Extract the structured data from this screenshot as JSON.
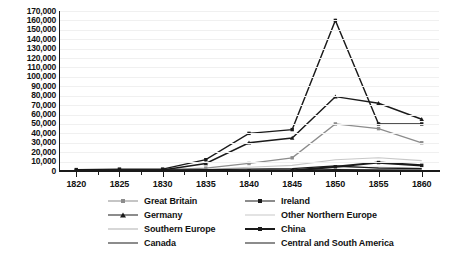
{
  "chart_data": {
    "type": "line",
    "title": "",
    "xlabel": "",
    "ylabel": "",
    "x": [
      1820,
      1825,
      1830,
      1835,
      1840,
      1845,
      1850,
      1855,
      1860
    ],
    "xlim": [
      1818,
      1862
    ],
    "ylim": [
      0,
      170000
    ],
    "ytick_labels": [
      "170,000",
      "160,000",
      "150,000",
      "140,000",
      "130,000",
      "120,000",
      "110,000",
      "100,000",
      "90,000",
      "80,000",
      "70,000",
      "60,000",
      "50,000",
      "40,000",
      "30,000",
      "20,000",
      "10,000",
      "0"
    ],
    "ytick_values": [
      170000,
      160000,
      150000,
      140000,
      130000,
      120000,
      110000,
      100000,
      90000,
      80000,
      70000,
      60000,
      50000,
      40000,
      30000,
      20000,
      10000,
      0
    ],
    "xtick_labels": [
      "1820",
      "1825",
      "1830",
      "1835",
      "1840",
      "1845",
      "1850",
      "1855",
      "1860"
    ],
    "grid": true,
    "legend_position": "bottom",
    "series": [
      {
        "name": "Great Britain",
        "color": "#8c8c8c",
        "marker": "square",
        "width": 1.3,
        "values": [
          1000,
          1000,
          1500,
          3000,
          8000,
          14000,
          50000,
          45000,
          30000
        ]
      },
      {
        "name": "Ireland",
        "color": "#1a1a1a",
        "marker": "square",
        "width": 1.4,
        "values": [
          1500,
          2000,
          2000,
          12000,
          40000,
          44000,
          160000,
          50000,
          50000
        ]
      },
      {
        "name": "Germany",
        "color": "#1a1a1a",
        "marker": "triangle",
        "width": 1.4,
        "values": [
          500,
          500,
          1000,
          8000,
          30000,
          35000,
          79000,
          72000,
          55000
        ]
      },
      {
        "name": "Other Northern Europe",
        "color": "#c8c8c8",
        "marker": "none",
        "width": 1.1,
        "values": [
          300,
          300,
          500,
          1500,
          4000,
          6000,
          12000,
          14000,
          11000
        ]
      },
      {
        "name": "Southern Europe",
        "color": "#b0b0b0",
        "marker": "none",
        "width": 1.1,
        "values": [
          200,
          200,
          300,
          500,
          1000,
          1500,
          3500,
          4000,
          3000
        ]
      },
      {
        "name": "China",
        "color": "#1a1a1a",
        "marker": "square",
        "width": 2.2,
        "values": [
          100,
          100,
          100,
          100,
          200,
          300,
          4500,
          9000,
          6000
        ]
      },
      {
        "name": "Canada",
        "color": "#1a1a1a",
        "marker": "none",
        "width": 1.2,
        "values": [
          1000,
          1200,
          1200,
          1500,
          2000,
          2500,
          5500,
          3000,
          2500
        ]
      },
      {
        "name": "Central and South America",
        "color": "#1a1a1a",
        "marker": "none",
        "width": 1.2,
        "values": [
          400,
          400,
          400,
          500,
          700,
          900,
          1500,
          1200,
          1000
        ]
      }
    ]
  },
  "legend": {
    "items": [
      {
        "label": "Great Britain"
      },
      {
        "label": "Ireland"
      },
      {
        "label": "Germany"
      },
      {
        "label": "Other Northern Europe"
      },
      {
        "label": "Southern Europe"
      },
      {
        "label": "China"
      },
      {
        "label": "Canada"
      },
      {
        "label": "Central and South America"
      }
    ]
  }
}
